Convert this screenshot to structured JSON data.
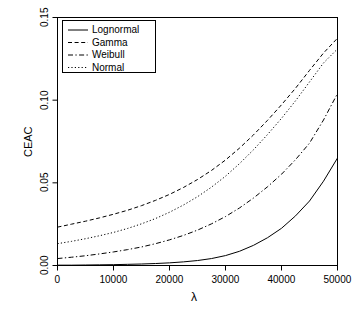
{
  "chart_data": {
    "type": "line",
    "title": "",
    "xlabel": "λ",
    "ylabel": "CEAC",
    "xlim": [
      0,
      50000
    ],
    "ylim": [
      0,
      0.15
    ],
    "grid": false,
    "legend_position": "top-left",
    "xticks": [
      0,
      10000,
      20000,
      30000,
      40000,
      50000
    ],
    "xticklabels": [
      "0",
      "10000",
      "20000",
      "30000",
      "40000",
      "50000"
    ],
    "yticks": [
      0.0,
      0.05,
      0.1,
      0.15
    ],
    "yticklabels": [
      "0.00",
      "0.05",
      "0.10",
      "0.15"
    ],
    "x": [
      0,
      2500,
      5000,
      7500,
      10000,
      12500,
      15000,
      17500,
      20000,
      22500,
      25000,
      27500,
      30000,
      32500,
      35000,
      37500,
      40000,
      42500,
      45000,
      47500,
      50000
    ],
    "series": [
      {
        "name": "Lognormal",
        "dash": "solid",
        "color": "#000000",
        "values": [
          0.0002,
          0.0002,
          0.0003,
          0.0004,
          0.0005,
          0.0007,
          0.0009,
          0.0012,
          0.0016,
          0.0022,
          0.003,
          0.0042,
          0.006,
          0.0086,
          0.0122,
          0.0168,
          0.0225,
          0.03,
          0.039,
          0.051,
          0.065
        ]
      },
      {
        "name": "Gamma",
        "dash": "dashed",
        "color": "#000000",
        "values": [
          0.0232,
          0.025,
          0.0268,
          0.0288,
          0.031,
          0.0334,
          0.0362,
          0.0394,
          0.043,
          0.0472,
          0.052,
          0.0575,
          0.0638,
          0.071,
          0.079,
          0.0878,
          0.0972,
          0.1072,
          0.118,
          0.1285,
          0.1375
        ]
      },
      {
        "name": "Weibull",
        "dash": "dashdot",
        "color": "#000000",
        "values": [
          0.0042,
          0.005,
          0.0059,
          0.007,
          0.0082,
          0.0096,
          0.0112,
          0.0132,
          0.0155,
          0.0182,
          0.0214,
          0.0252,
          0.0296,
          0.0348,
          0.0408,
          0.0476,
          0.0552,
          0.064,
          0.074,
          0.088,
          0.104
        ]
      },
      {
        "name": "Normal",
        "dash": "dotted",
        "color": "#000000",
        "values": [
          0.0132,
          0.0146,
          0.0162,
          0.018,
          0.02,
          0.0224,
          0.0252,
          0.0284,
          0.0322,
          0.0366,
          0.0416,
          0.0474,
          0.054,
          0.0616,
          0.07,
          0.0792,
          0.089,
          0.0996,
          0.111,
          0.1225,
          0.131
        ]
      }
    ]
  },
  "legend": {
    "items": [
      {
        "label": "Lognormal",
        "dash": "solid"
      },
      {
        "label": "Gamma",
        "dash": "dashed"
      },
      {
        "label": "Weibull",
        "dash": "dashdot"
      },
      {
        "label": "Normal",
        "dash": "dotted"
      }
    ]
  },
  "axes": {
    "x_title": "λ",
    "y_title": "CEAC"
  }
}
